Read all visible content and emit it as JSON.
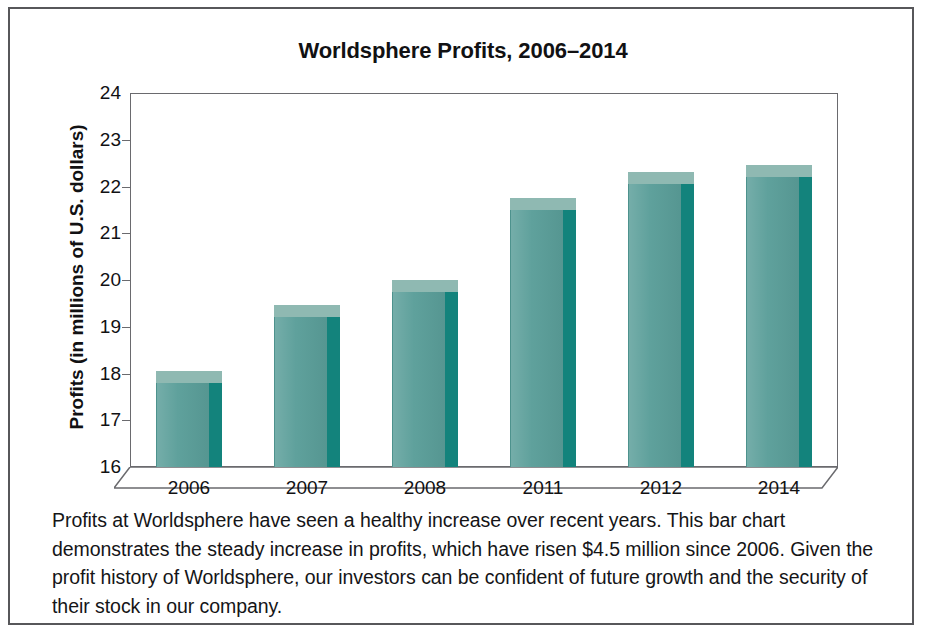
{
  "chart_data": {
    "type": "bar",
    "title": "Worldsphere Profits, 2006–2014",
    "xlabel": "",
    "ylabel": "Profits (in millions of U.S. dollars)",
    "categories": [
      "2006",
      "2007",
      "2008",
      "2011",
      "2012",
      "2014"
    ],
    "values": [
      17.8,
      19.2,
      19.75,
      21.5,
      22.05,
      22.2
    ],
    "ylim": [
      16,
      24
    ],
    "ytick_labels": [
      "24",
      "23",
      "22",
      "21",
      "20",
      "19",
      "18",
      "17",
      "16"
    ],
    "ytick_values": [
      24,
      23,
      22,
      21,
      20,
      19,
      18,
      17,
      16
    ],
    "grid": false,
    "legend": false,
    "bar_color": "#5a9e99",
    "bar_side_color": "#13837c",
    "bar_top_color": "#8fb9b2",
    "style": "3d-column"
  },
  "caption": {
    "text": "Profits at Worldsphere have seen a healthy increase over recent years. This bar chart demonstrates the steady increase in profits, which have risen $4.5 million since 2006. Given the profit history of Worldsphere, our investors can be confident of future growth and the security of their stock in our company."
  }
}
